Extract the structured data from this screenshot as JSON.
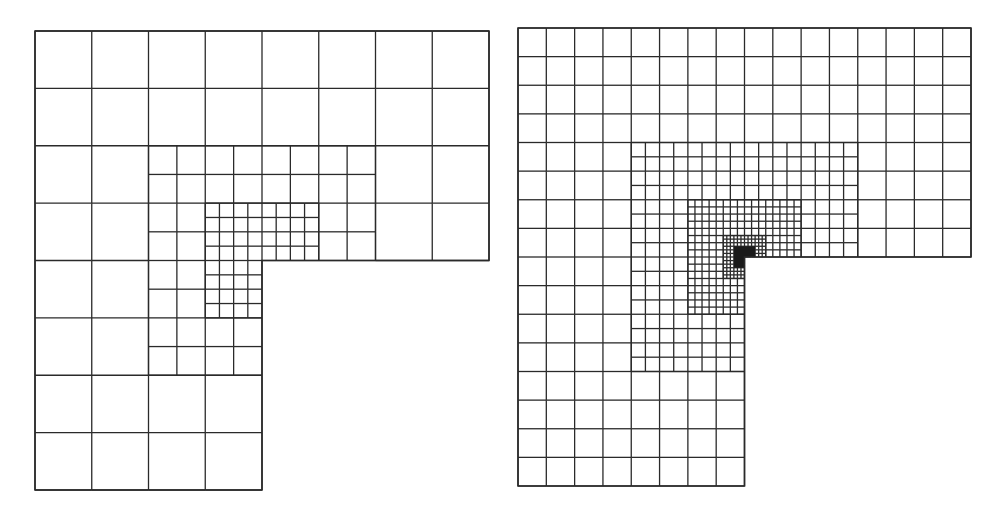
{
  "figure": {
    "stroke_color": "#2a2a2a",
    "background": "#ffffff"
  },
  "meshes": [
    {
      "id": "left",
      "label": "mesh-coarse-refinement",
      "bounds": {
        "x0": 35,
        "y0": 31,
        "x1": 489,
        "y1": 490
      },
      "coarse_cols": 8,
      "coarse_rows": 8,
      "lshape": {
        "cut_col": 4,
        "cut_row": 4
      },
      "refinements": [
        {
          "level": 1,
          "c0": 2,
          "r0": 2,
          "c1": 6,
          "r1": 6,
          "corner_col": 4,
          "corner_row": 4
        },
        {
          "level": 2,
          "c0": 3,
          "r0": 3,
          "c1": 5,
          "r1": 5,
          "corner_col": 4,
          "corner_row": 4
        }
      ],
      "dense_core": null
    },
    {
      "id": "right",
      "label": "mesh-fine-refinement",
      "bounds": {
        "x0": 518,
        "y0": 28,
        "x1": 971,
        "y1": 486
      },
      "coarse_cols": 16,
      "coarse_rows": 16,
      "lshape": {
        "cut_col": 8,
        "cut_row": 8
      },
      "refinements": [
        {
          "level": 1,
          "c0": 4,
          "r0": 4,
          "c1": 12,
          "r1": 12,
          "corner_col": 8,
          "corner_row": 8
        },
        {
          "level": 2,
          "c0": 6,
          "r0": 6,
          "c1": 10,
          "r1": 10,
          "corner_col": 8,
          "corner_row": 8
        },
        {
          "level": 3,
          "c0": 7.25,
          "r0": 7.25,
          "c1": 8.75,
          "r1": 8.75,
          "corner_col": 8,
          "corner_row": 8
        }
      ],
      "dense_core": {
        "c0": 7.625,
        "r0": 7.625,
        "c1": 8.375,
        "r1": 8.375,
        "corner_col": 8,
        "corner_row": 8
      }
    }
  ]
}
